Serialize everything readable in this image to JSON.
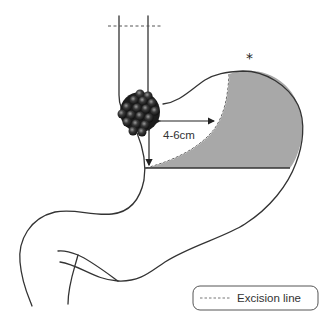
{
  "diagram": {
    "title": "",
    "annotations": {
      "distance_label": "4-6cm",
      "star_marker": "*"
    },
    "legend": {
      "items": [
        {
          "symbol": "dashed-line",
          "label": "Excision line"
        }
      ]
    },
    "colors": {
      "outline": "#333333",
      "resected_area": "#a8a8a8",
      "tumor_dark": "#1a1a1a",
      "tumor_highlight": "#8a8a8a",
      "background": "#ffffff"
    },
    "elements": [
      "esophagus",
      "proximal-esophageal-excision-line",
      "tumor",
      "stomach-outline",
      "resected-region-shaded",
      "distal-excision-line",
      "duodenum",
      "distance-arrows"
    ]
  }
}
